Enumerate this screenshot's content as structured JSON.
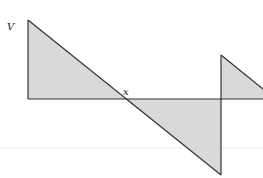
{
  "diagram": {
    "type": "shear-force-diagram",
    "labels": {
      "v_label": "V",
      "x_label": "x"
    },
    "colors": {
      "fill": "#d9d9d9",
      "stroke": "#333333",
      "faint_line": "#ececec",
      "background": "#ffffff"
    },
    "geometry": {
      "baseline_y": 99,
      "start_x": 28,
      "top_y": 20,
      "zero_cross_x": 125,
      "jump_x": 221,
      "bottom_y": 175,
      "second_peak_y": 55,
      "end_x": 263,
      "end_y": 99
    }
  }
}
